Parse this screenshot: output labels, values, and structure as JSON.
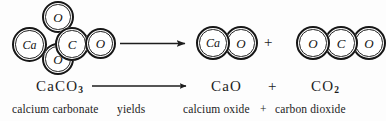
{
  "diagram": {
    "background_color": "#fdfdfd",
    "ink_color": "#161616",
    "reactants": {
      "molecule": {
        "name": "calcium-carbonate-model",
        "atoms": [
          {
            "label": "Ca",
            "x": 12,
            "y": 27,
            "d": 35
          },
          {
            "label": "O",
            "x": 42,
            "y": 1,
            "d": 32
          },
          {
            "label": "C",
            "x": 55,
            "y": 27,
            "d": 34
          },
          {
            "label": "O",
            "x": 42,
            "y": 43,
            "d": 32
          },
          {
            "label": "O",
            "x": 85,
            "y": 28,
            "d": 31
          }
        ]
      }
    },
    "reaction_arrow_top": {
      "name": "reaction-arrow-top",
      "x1": 120,
      "y1": 43,
      "x2": 186,
      "y2": 43
    },
    "plus_top": {
      "label": "+",
      "x": 264,
      "y": 35
    },
    "products": [
      {
        "name": "calcium-oxide-model",
        "atoms": [
          {
            "label": "Ca",
            "x": 196,
            "y": 26,
            "d": 34
          },
          {
            "label": "O",
            "x": 224,
            "y": 26,
            "d": 34
          }
        ]
      },
      {
        "name": "carbon-dioxide-model",
        "atoms": [
          {
            "label": "O",
            "x": 296,
            "y": 26,
            "d": 34
          },
          {
            "label": "C",
            "x": 324,
            "y": 26,
            "d": 34
          },
          {
            "label": "O",
            "x": 352,
            "y": 26,
            "d": 34
          }
        ]
      }
    ],
    "equation": {
      "reactant_formula": "CaCO",
      "reactant_subscript": "3",
      "arrow": {
        "name": "reaction-arrow-equation",
        "x1": 92,
        "y1": 86,
        "x2": 188,
        "y2": 86
      },
      "product_one_formula": "CaO",
      "plus": "+",
      "product_two_formula": "CO",
      "product_two_subscript": "2"
    },
    "caption": {
      "reactant_name": "calcium carbonate",
      "arrow_word": "yields",
      "product_one_name": "calcium oxide",
      "plus": "+",
      "product_two_name": "carbon dioxide"
    }
  }
}
